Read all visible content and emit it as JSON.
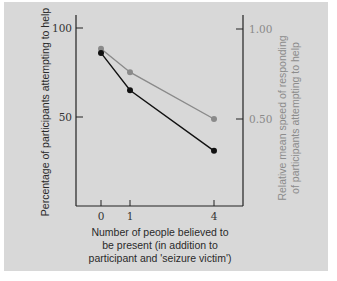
{
  "chart_data": {
    "type": "line",
    "title": "",
    "xlabel": "Number of people believed to be present (in addition to participant and 'seizure victim')",
    "xlabel_lines": [
      "Number of people believed to",
      "be present (in addition to",
      "participant and 'seizure victim')"
    ],
    "ylabel": "Percentage of participants attempting to help",
    "y2label": "Relative mean speed of responding of participants attempting to help",
    "y2label_lines": [
      "Relative mean speed of responding",
      "of participants attempting to help"
    ],
    "x": [
      0,
      1,
      4
    ],
    "x_tick_labels": [
      "0",
      "1",
      "4"
    ],
    "y_ticks": [
      50,
      100
    ],
    "y_tick_labels": [
      "50",
      "100"
    ],
    "y2_ticks": [
      0.5,
      1.0
    ],
    "y2_tick_labels": [
      "0.50",
      "1.00"
    ],
    "ylim": [
      0,
      107
    ],
    "y2lim": [
      0,
      1.0
    ],
    "grid": false,
    "series": [
      {
        "name": "Percentage of participants attempting to help",
        "axis": "left",
        "color": "#111111",
        "values": [
          86,
          65,
          31
        ]
      },
      {
        "name": "Relative mean speed of responding",
        "axis": "right",
        "color": "#8a8a8a",
        "values": [
          0.89,
          0.76,
          0.5
        ]
      }
    ]
  },
  "colors": {
    "panel_bg": "#d8d8d8",
    "axis": "#222222",
    "series_black": "#111111",
    "series_gray": "#8a8a8a"
  }
}
